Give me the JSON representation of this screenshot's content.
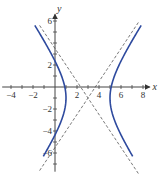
{
  "chart_data": {
    "type": "line",
    "title": "",
    "xlabel": "x",
    "ylabel": "y",
    "xlim": [
      -4.8,
      8.6
    ],
    "ylim": [
      -7.7,
      6.6
    ],
    "xticks": [
      -4,
      -3,
      -2,
      -1,
      0,
      1,
      2,
      3,
      4,
      5,
      6,
      7,
      8
    ],
    "xtick_labels": [
      {
        "value": -4,
        "label": "−4"
      },
      {
        "value": -2,
        "label": "−2"
      },
      {
        "value": 2,
        "label": "2"
      },
      {
        "value": 4,
        "label": "4"
      },
      {
        "value": 6,
        "label": "6"
      },
      {
        "value": 8,
        "label": "8"
      }
    ],
    "yticks": [
      -7,
      -6,
      -5,
      -4,
      -3,
      -2,
      -1,
      1,
      2,
      3,
      4,
      5,
      6
    ],
    "ytick_labels": [
      {
        "value": 6,
        "label": "6"
      },
      {
        "value": 2,
        "label": "2"
      },
      {
        "value": -2,
        "label": "−2"
      },
      {
        "value": -4,
        "label": "−4"
      },
      {
        "value": -6,
        "label": "−6"
      }
    ],
    "grid": false,
    "legend": null,
    "hyperbola": {
      "center": [
        3,
        -1
      ],
      "a": 2,
      "b": 3,
      "orientation": "horizontal",
      "y_range": [
        -6.3,
        5.6
      ]
    },
    "series": [
      {
        "name": "hyperbola-left-branch",
        "style": "solid",
        "color": "#2e4a9e"
      },
      {
        "name": "hyperbola-right-branch",
        "style": "solid",
        "color": "#2e4a9e"
      },
      {
        "name": "asymptote y+1 = 1.5(x-3)",
        "style": "dashed",
        "color": "#555555",
        "slope": 1.5,
        "x_range": [
          -1.4,
          7.6
        ]
      },
      {
        "name": "asymptote y+1 = -1.5(x-3)",
        "style": "dashed",
        "color": "#555555",
        "slope": -1.5,
        "x_range": [
          -1.4,
          7.6
        ]
      }
    ],
    "vertices": [
      [
        1,
        -1
      ],
      [
        5,
        -1
      ]
    ]
  },
  "colors": {
    "curve": "#2e4a9e",
    "axis": "#444444",
    "asymptote": "#555555"
  }
}
